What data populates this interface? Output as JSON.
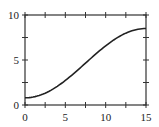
{
  "chart_data": {
    "type": "line",
    "title": "",
    "xlabel": "",
    "ylabel": "",
    "xlim": [
      0,
      15
    ],
    "ylim": [
      0,
      10
    ],
    "x_ticks": [
      "0",
      "5",
      "10",
      "15"
    ],
    "y_ticks": [
      "0",
      "5",
      "10"
    ],
    "grid": false,
    "legend": null,
    "series": [
      {
        "name": "curve",
        "x": [
          0,
          1.5,
          3,
          4.5,
          6,
          7.5,
          9,
          10.5,
          12,
          13.5,
          15
        ],
        "y": [
          0.8,
          0.99,
          1.54,
          2.39,
          3.46,
          4.65,
          5.84,
          6.91,
          7.76,
          8.31,
          8.5
        ]
      }
    ]
  },
  "axes": {
    "x_labels": [
      "0",
      "5",
      "10",
      "15"
    ],
    "y_labels": [
      "0",
      "5",
      "10"
    ]
  },
  "colors": {
    "line": "#222222",
    "axis": "#333333"
  }
}
